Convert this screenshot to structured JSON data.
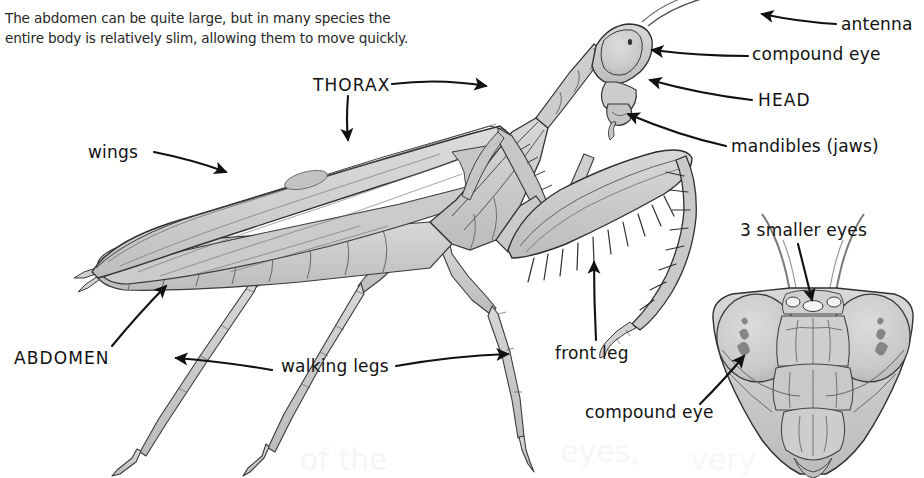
{
  "page": {
    "width": 924,
    "height": 478,
    "background": "#ffffff",
    "kind": "textbook-figure"
  },
  "paragraph": {
    "text": "The abdomen can be quite large, but in many species the\nentire body is relatively slim, allowing them to move quickly."
  },
  "labels": {
    "thorax": "THORAX",
    "wings": "wings",
    "abdomen": "ABDOMEN",
    "walking_legs": "walking legs",
    "front_leg": "front leg",
    "antenna": "antenna",
    "compound_eye_side": "compound eye",
    "head": "HEAD",
    "mandibles": "mandibles (jaws)",
    "three_smaller_eyes": "3 smaller eyes",
    "compound_eye_front": "compound eye"
  },
  "colors": {
    "ink": "#111111",
    "body_text": "#262626",
    "fill_light": "#d9d9d9",
    "fill_mid": "#c9c9c9",
    "fill_dark": "#b0b0b0",
    "outline": "#2b2b2b",
    "ghost": "#e9e9e9",
    "background": "#ffffff"
  },
  "figures": {
    "side_view": {
      "name": "lateral view of praying mantis",
      "parts": [
        "wings",
        "thorax",
        "abdomen",
        "head",
        "front leg",
        "walking legs"
      ]
    },
    "front_view": {
      "name": "frontal view of mantis head",
      "parts": [
        "compound eye",
        "3 smaller eyes",
        "antennae",
        "mandibles"
      ]
    }
  }
}
